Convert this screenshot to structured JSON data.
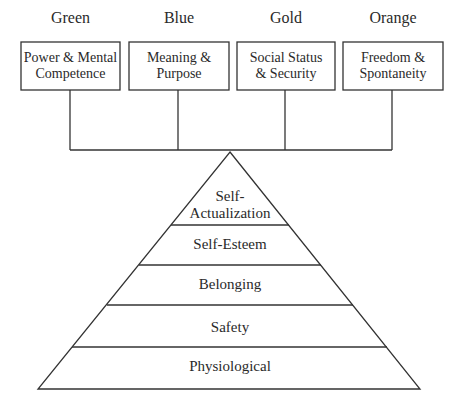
{
  "diagram": {
    "type": "hierarchy-pyramid",
    "line_color": "#333333",
    "temperaments": [
      {
        "color_name": "Green",
        "need": "Power & Mental Competence",
        "need_line1": "Power & Mental",
        "need_line2": "Competence"
      },
      {
        "color_name": "Blue",
        "need": "Meaning & Purpose",
        "need_line1": "Meaning &",
        "need_line2": "Purpose"
      },
      {
        "color_name": "Gold",
        "need": "Social Status & Security",
        "need_line1": "Social Status",
        "need_line2": "& Security"
      },
      {
        "color_name": "Orange",
        "need": "Freedom & Spontaneity",
        "need_line1": "Freedom &",
        "need_line2": "Spontaneity"
      }
    ],
    "pyramid_levels_top_to_bottom": [
      {
        "label": "Self-Actualization",
        "line1": "Self-",
        "line2": "Actualization"
      },
      {
        "label": "Self-Esteem"
      },
      {
        "label": "Belonging"
      },
      {
        "label": "Safety"
      },
      {
        "label": "Physiological"
      }
    ]
  }
}
